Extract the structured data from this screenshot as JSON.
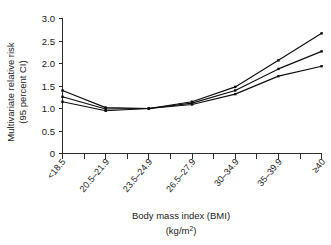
{
  "chart_data": {
    "type": "line",
    "title": "",
    "subtitle": "",
    "xlabel": "Body mass index (BMI)",
    "xlabel_units": "(kg/m2)",
    "xlabel_units_base": "(kg/m",
    "xlabel_units_sup": "2",
    "xlabel_units_close": ")",
    "ylabel": "Multivariate relative risk",
    "ylabel_line2": "(95 percent CI)",
    "ylim": [
      0,
      3.0
    ],
    "yticks": [
      0,
      0.5,
      1.0,
      1.5,
      2.0,
      2.5,
      3.0
    ],
    "ytick_labels": [
      "0",
      "0.5",
      "1.0",
      "1.5",
      "2.0",
      "2.5",
      "3.0"
    ],
    "grid": false,
    "legend": "none",
    "categories": [
      "<18.5",
      "20.5–21.9",
      "23.5–24.9",
      "26.5–27.9",
      "30–34.9",
      "35–39.9",
      "≥40"
    ],
    "x_positions": [
      0,
      2,
      4,
      6,
      8,
      10,
      12
    ],
    "x_tick_count": 13,
    "series": [
      {
        "name": "Upper 95% confidence limit",
        "values": [
          1.4,
          1.02,
          1.0,
          1.15,
          1.48,
          2.07,
          2.67
        ]
      },
      {
        "name": "Multivariate relative risk",
        "values": [
          1.26,
          0.99,
          1.0,
          1.12,
          1.4,
          1.88,
          2.27
        ]
      },
      {
        "name": "Lower 95% confidence limit",
        "values": [
          1.15,
          0.95,
          1.0,
          1.09,
          1.32,
          1.72,
          1.94
        ]
      }
    ]
  },
  "figure": {
    "background_color": "#ffffff",
    "line_color": "#0d0d0d",
    "axis_color": "#2b2b2b"
  }
}
